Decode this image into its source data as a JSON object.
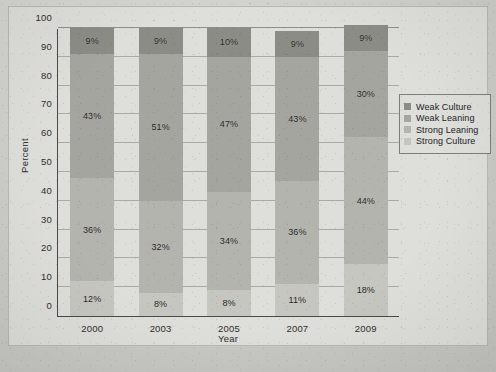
{
  "chart_data": {
    "type": "bar",
    "subtype": "stacked-100-percent",
    "title": "",
    "xlabel": "Year",
    "ylabel": "Percent",
    "categories": [
      "2000",
      "2003",
      "2005",
      "2007",
      "2009"
    ],
    "ylim": [
      0,
      100
    ],
    "yticks": [
      0,
      10,
      20,
      30,
      40,
      50,
      60,
      70,
      80,
      90,
      100
    ],
    "ytick_labels": [
      "0",
      "10",
      "20",
      "30",
      "40",
      "50",
      "60",
      "70",
      "80",
      "90",
      "100"
    ],
    "grid": true,
    "legend_position": "right",
    "stack_order_bottom_to_top": [
      "Strong Culture",
      "Strong Leaning",
      "Weak Leaning",
      "Weak Culture"
    ],
    "series": [
      {
        "name": "Weak Culture",
        "color": "#8c8c87",
        "values": [
          9,
          9,
          10,
          9,
          9
        ],
        "labels": [
          "9%",
          "9%",
          "10%",
          "9%",
          "9%"
        ]
      },
      {
        "name": "Weak Leaning",
        "color": "#a5a5a0",
        "values": [
          43,
          51,
          47,
          43,
          30
        ],
        "labels": [
          "43%",
          "51%",
          "47%",
          "43%",
          "30%"
        ]
      },
      {
        "name": "Strong Leaning",
        "color": "#b4b4af",
        "values": [
          36,
          32,
          34,
          36,
          44
        ],
        "labels": [
          "36%",
          "32%",
          "34%",
          "36%",
          "44%"
        ]
      },
      {
        "name": "Strong Culture",
        "color": "#c6c6c1",
        "values": [
          12,
          8,
          9,
          11,
          18
        ],
        "labels": [
          "12%",
          "8%",
          "8%",
          "11%",
          "18%"
        ]
      }
    ]
  },
  "legend": {
    "items": [
      {
        "label": "Weak Culture",
        "color": "#8c8c87"
      },
      {
        "label": "Weak Leaning",
        "color": "#a5a5a0"
      },
      {
        "label": "Strong Leaning",
        "color": "#b4b4af"
      },
      {
        "label": "Strong Culture",
        "color": "#c6c6c1"
      }
    ]
  },
  "axes": {
    "y_title": "Percent",
    "x_title": "Year"
  }
}
